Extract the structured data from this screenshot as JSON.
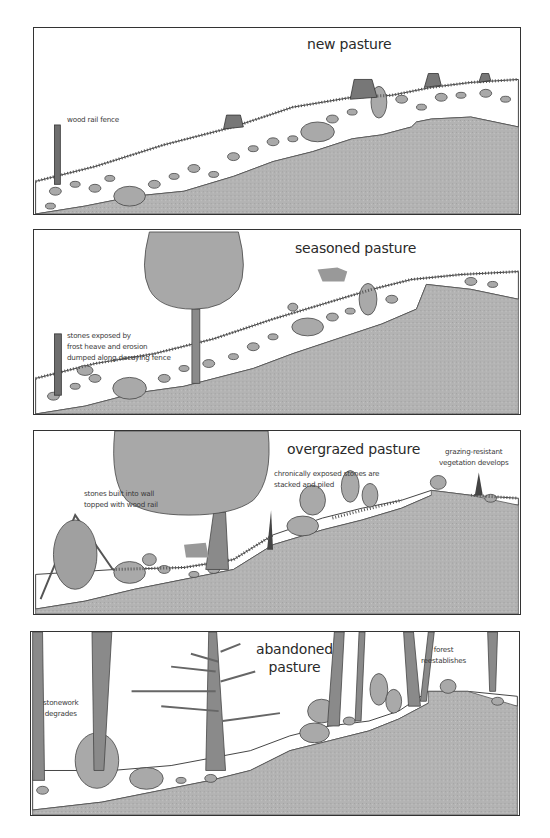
{
  "figure": {
    "panels": [
      {
        "title": "new pasture",
        "labels": [
          "wood rail fence"
        ]
      },
      {
        "title": "seasoned pasture",
        "labels": [
          "stones exposed by\nfrost heave and erosion\ndumped along decaying fence"
        ]
      },
      {
        "title": "overgrazed pasture",
        "labels": [
          "stones built into wall\ntopped with wood rail",
          "chronically exposed stones are\nstacked and piled",
          "grazing-resistant\nvegetation develops"
        ]
      },
      {
        "title": "abandoned\npasture",
        "labels": [
          "stonework\ndegrades",
          "forest\nreestablishes"
        ]
      }
    ],
    "colors": {
      "ground": "#b2b2b2",
      "stone": "#a9a9a9",
      "outline": "#444444",
      "canopy": "#a8a8a8",
      "trunk": "#8a8a8a",
      "background": "#ffffff"
    }
  }
}
